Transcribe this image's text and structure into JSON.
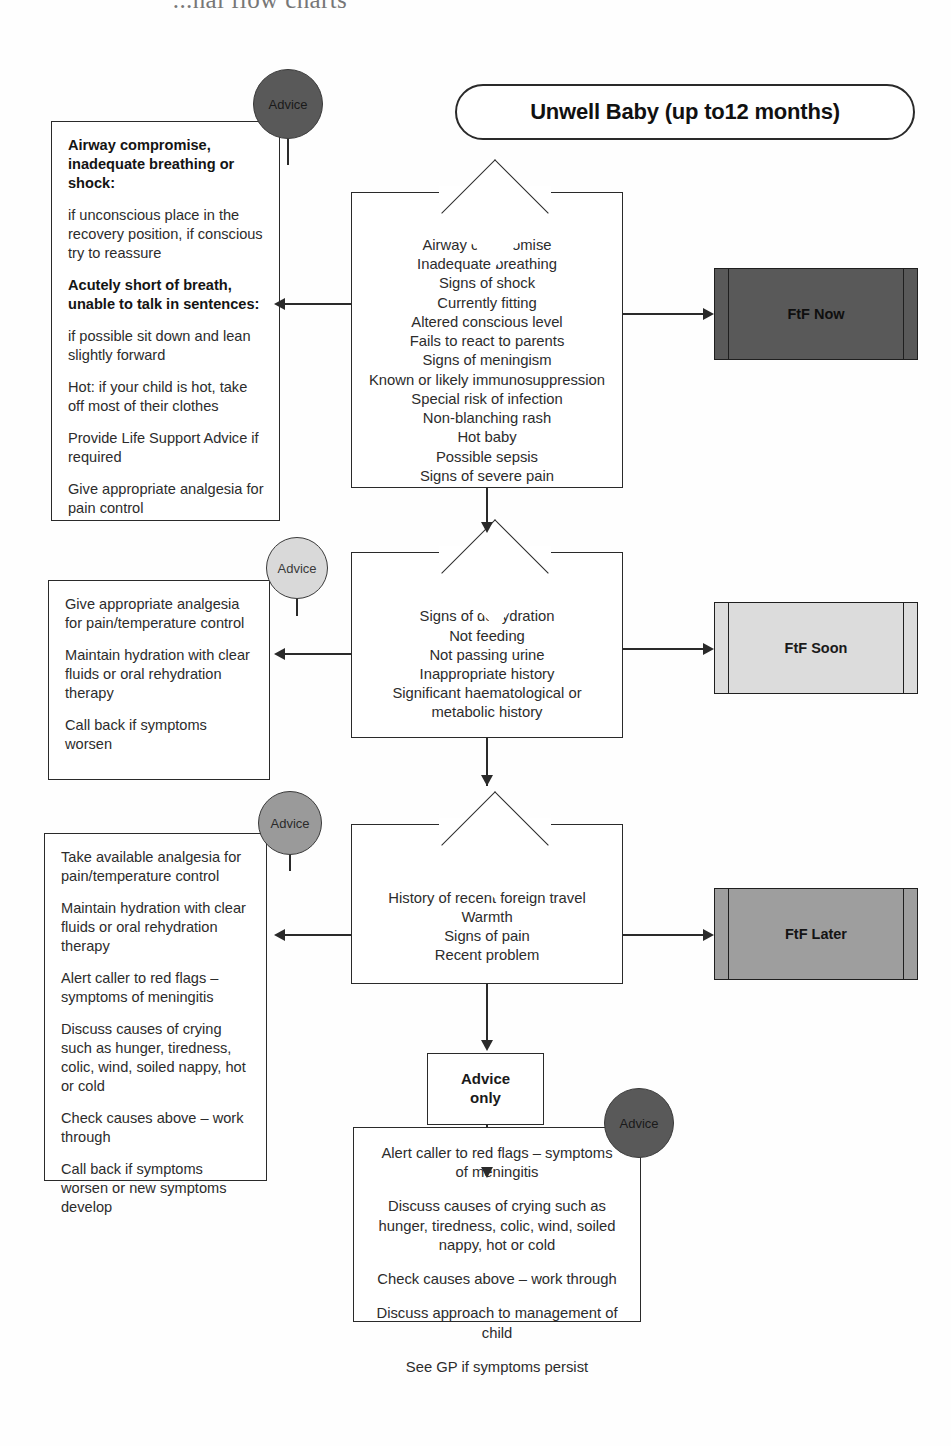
{
  "page": {
    "clipped_header": "...nal flow charts",
    "title": "Unwell Baby (up to12 months)"
  },
  "advice_label": "Advice",
  "advice_circles": [
    {
      "label": "Advice",
      "shade": "dark"
    },
    {
      "label": "Advice",
      "shade": "light"
    },
    {
      "label": "Advice",
      "shade": "medium"
    },
    {
      "label": "Advice",
      "shade": "dark"
    }
  ],
  "advice_boxes": [
    {
      "id": "advice-box-now",
      "lines": [
        {
          "text": "Airway compromise, inadequate breathing or shock:",
          "bold": true
        },
        {
          "text": "if unconscious place in the recovery position, if conscious try to reassure",
          "bold": false
        },
        {
          "text": "Acutely short of breath, unable to talk in sentences:",
          "bold": true
        },
        {
          "text": "if possible sit down and lean slightly forward",
          "bold": false
        },
        {
          "text": "Hot: if your child is hot, take off most of their clothes",
          "bold": false
        },
        {
          "text": "Provide Life Support Advice if required",
          "bold": false
        },
        {
          "text": "Give appropriate analgesia for pain control",
          "bold": false
        }
      ]
    },
    {
      "id": "advice-box-soon",
      "lines": [
        {
          "text": "Give appropriate analgesia for pain/temperature control",
          "bold": false
        },
        {
          "text": "Maintain hydration with clear fluids or oral rehydration therapy",
          "bold": false
        },
        {
          "text": "Call back if symptoms worsen",
          "bold": false
        }
      ]
    },
    {
      "id": "advice-box-later",
      "lines": [
        {
          "text": "Take available analgesia for pain/temperature control",
          "bold": false
        },
        {
          "text": "Maintain hydration with clear fluids or oral rehydration therapy",
          "bold": false
        },
        {
          "text": "Alert caller to red flags – symptoms of meningitis",
          "bold": false
        },
        {
          "text": "Discuss causes of crying such as hunger, tiredness, colic, wind, soiled nappy, hot or cold",
          "bold": false
        },
        {
          "text": "Check causes above – work through",
          "bold": false
        },
        {
          "text": "Call back if symptoms worsen or new symptoms develop",
          "bold": false
        }
      ]
    }
  ],
  "decisions": [
    {
      "id": "decision-ftf-now",
      "criteria": [
        "Airway compromise",
        "Inadequate breathing",
        "Signs of shock",
        "Currently fitting",
        "Altered conscious level",
        "Fails to react to parents",
        "Signs of meningism",
        "Known or likely immunosuppression",
        "Special risk of infection",
        "Non-blanching rash",
        "Hot baby",
        "Possible sepsis",
        "Signs of severe pain"
      ]
    },
    {
      "id": "decision-ftf-soon",
      "criteria": [
        "Signs of dehydration",
        "Not feeding",
        "Not passing urine",
        "Inappropriate history",
        "Significant haematological or",
        "metabolic history"
      ]
    },
    {
      "id": "decision-ftf-later",
      "criteria": [
        "History of recent foreign travel",
        "Warmth",
        "Signs of pain",
        "Recent problem"
      ]
    }
  ],
  "outcomes": [
    {
      "id": "ftf-now-box",
      "label": "FtF Now",
      "shade": "#595959"
    },
    {
      "id": "ftf-soon-box",
      "label": "FtF Soon",
      "shade": "#dcdcdc"
    },
    {
      "id": "ftf-later-box",
      "label": "FtF Later",
      "shade": "#9e9e9e"
    }
  ],
  "advice_only_box": {
    "line1": "Advice",
    "line2": "only"
  },
  "final_advice_box": {
    "lines": [
      "Alert caller to red flags – symptoms of meningitis",
      "Discuss causes of crying such as hunger, tiredness, colic, wind, soiled nappy, hot or cold",
      "Check causes above – work through",
      "Discuss approach to management of child",
      "See GP if symptoms persist"
    ]
  }
}
